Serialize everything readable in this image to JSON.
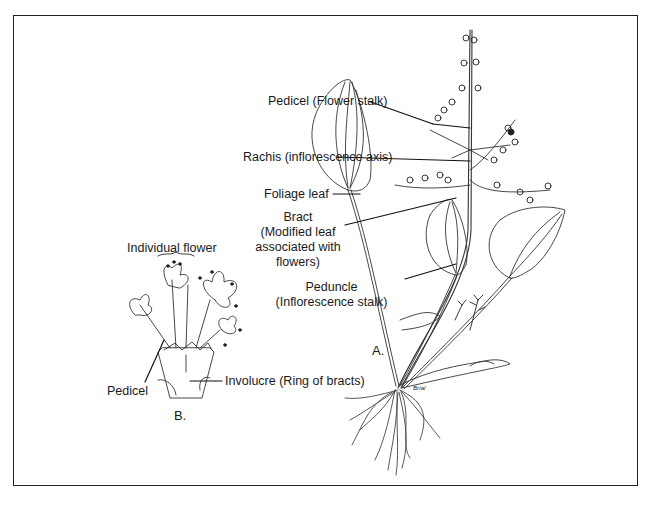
{
  "figure": {
    "panel_a_label": "A.",
    "panel_b_label": "B.",
    "signature": "Bríal"
  },
  "labels_a": {
    "pedicel": "Pedicel (Flower stalk)",
    "rachis": "Rachis (inflorescence axis)",
    "foliage_leaf": "Foliage leaf",
    "bract_line1": "Bract",
    "bract_line2": "(Modified leaf",
    "bract_line3": "associated with",
    "bract_line4": "flowers)",
    "peduncle_line1": "Peduncle",
    "peduncle_line2": "(Inflorescence stalk)"
  },
  "labels_b": {
    "individual_flower": "Individual flower",
    "pedicel": "Pedicel",
    "involucre": "Involucre (Ring of bracts)"
  },
  "colors": {
    "ink": "#1a1a1a",
    "background": "#ffffff"
  }
}
